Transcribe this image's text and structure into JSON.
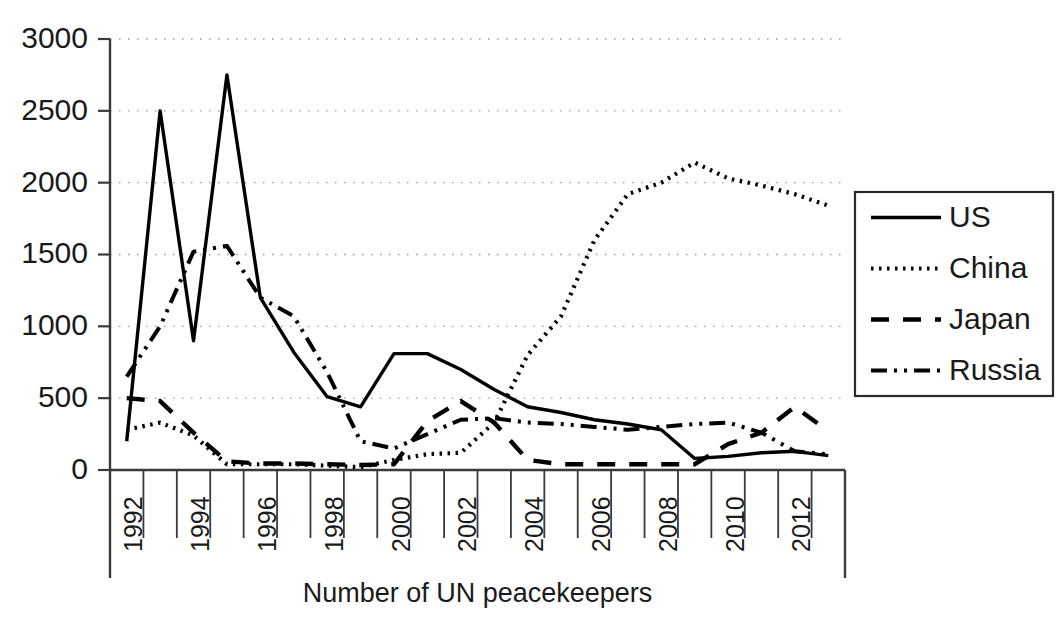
{
  "chart_data": {
    "type": "line",
    "title": "",
    "xlabel": "Number of UN peacekeepers",
    "ylabel": "",
    "xlim": [
      1991.5,
      2013.5
    ],
    "ylim": [
      0,
      3000
    ],
    "grid": true,
    "legend_position": "right",
    "x": [
      1992,
      1993,
      1994,
      1995,
      1996,
      1997,
      1998,
      1999,
      2000,
      2001,
      2002,
      2003,
      2004,
      2005,
      2006,
      2007,
      2008,
      2009,
      2010,
      2011,
      2012,
      2013
    ],
    "xticks": [
      1992,
      1994,
      1996,
      1998,
      2000,
      2002,
      2004,
      2006,
      2008,
      2010,
      2012
    ],
    "xtick_labels": [
      "1992",
      "1994",
      "1996",
      "1998",
      "2000",
      "2002",
      "2004",
      "2006",
      "2008",
      "2010",
      "2012"
    ],
    "yticks": [
      0,
      500,
      1000,
      1500,
      2000,
      2500,
      3000
    ],
    "ytick_labels": [
      "0",
      "500",
      "1000",
      "1500",
      "2000",
      "2500",
      "3000"
    ],
    "series": [
      {
        "name": "US",
        "style": "solid",
        "color": "#000000",
        "values": [
          200,
          2500,
          900,
          2750,
          1200,
          820,
          510,
          440,
          810,
          810,
          700,
          560,
          440,
          400,
          350,
          320,
          280,
          80,
          95,
          120,
          130,
          100
        ]
      },
      {
        "name": "China",
        "style": "dotted",
        "color": "#000000",
        "values": [
          280,
          330,
          240,
          40,
          40,
          40,
          30,
          20,
          70,
          110,
          120,
          330,
          800,
          1070,
          1600,
          1920,
          2000,
          2140,
          2030,
          1980,
          1920,
          1840
        ]
      },
      {
        "name": "Japan",
        "style": "dashed",
        "color": "#000000",
        "values": [
          500,
          480,
          260,
          60,
          45,
          45,
          40,
          35,
          40,
          340,
          480,
          330,
          70,
          40,
          40,
          40,
          40,
          40,
          180,
          260,
          440,
          270
        ]
      },
      {
        "name": "Russia",
        "style": "dashdotdot",
        "color": "#000000",
        "values": [
          650,
          1000,
          1520,
          1560,
          1200,
          1070,
          680,
          200,
          150,
          250,
          350,
          360,
          330,
          320,
          300,
          280,
          300,
          320,
          330,
          260,
          130,
          110
        ]
      }
    ]
  },
  "legend": {
    "entries": [
      {
        "label": "US",
        "sample": "solid-line-sample"
      },
      {
        "label": "China",
        "sample": "dotted-line-sample"
      },
      {
        "label": "Japan",
        "sample": "dashed-line-sample"
      },
      {
        "label": "Russia",
        "sample": "dashdotdot-line-sample"
      }
    ]
  },
  "axis": {
    "x_title": "Number of UN peacekeepers"
  }
}
